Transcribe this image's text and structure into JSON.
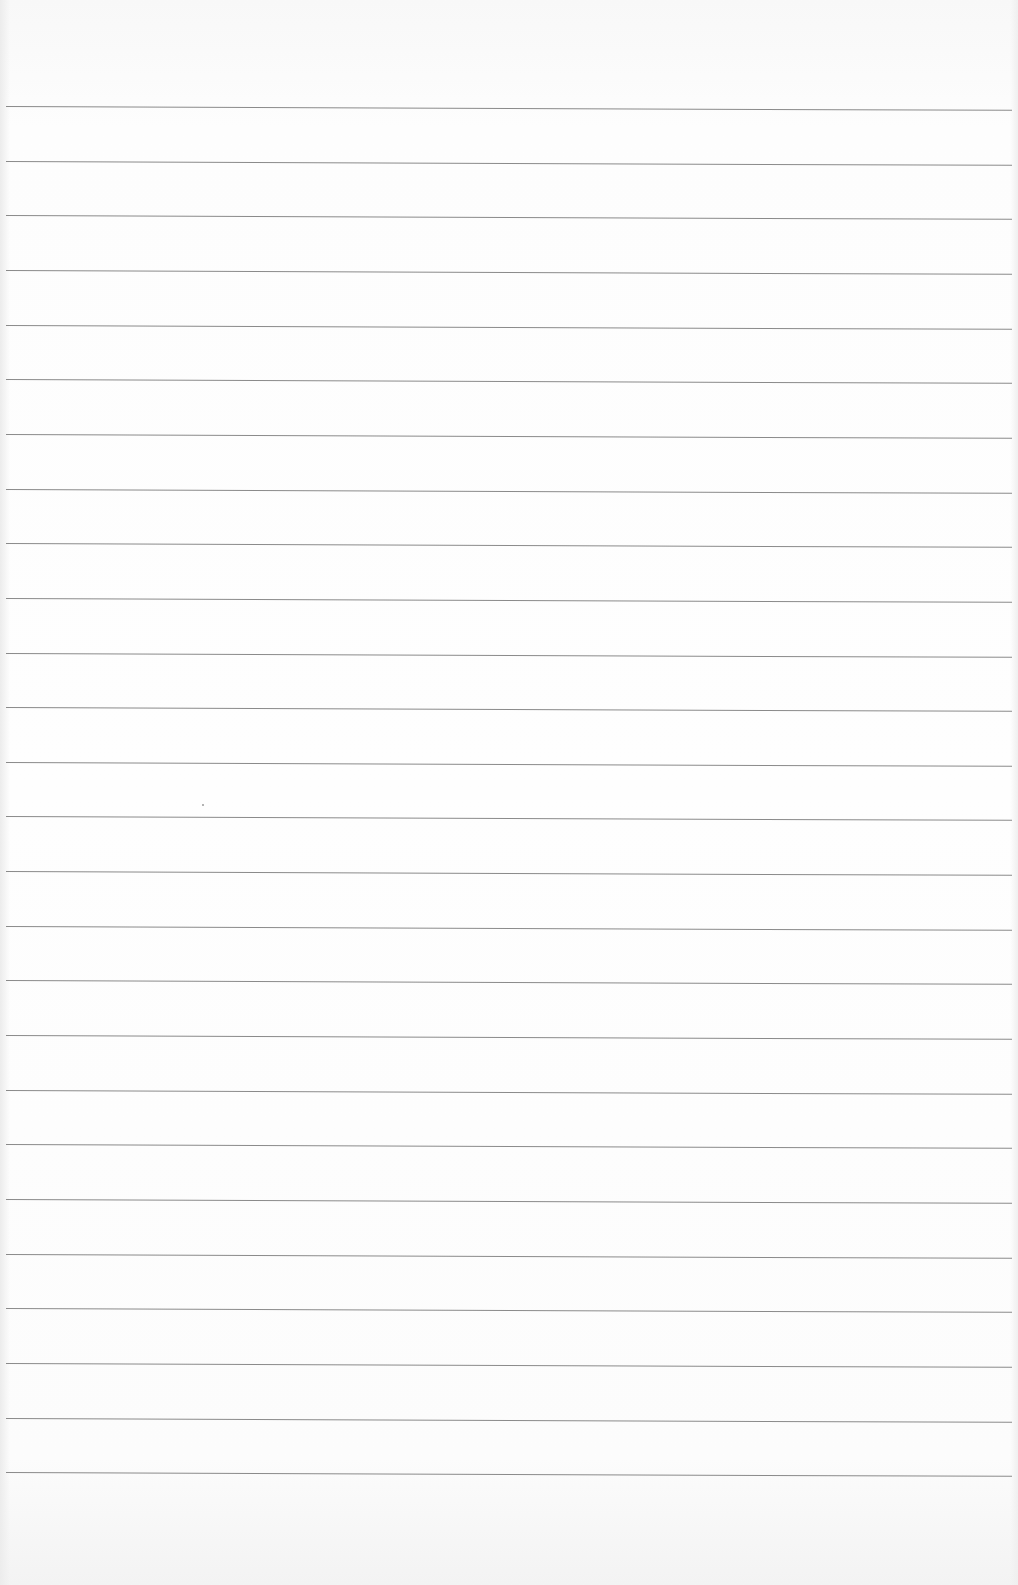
{
  "page": {
    "type": "ruled-paper",
    "background_color": "#fdfdfd",
    "line_color": "#8a8a8a",
    "line_count": 26,
    "first_line_y": 106,
    "line_spacing": 54.65,
    "text": ""
  }
}
